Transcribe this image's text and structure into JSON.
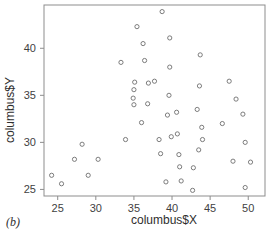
{
  "figure": {
    "panel_label": "(b)",
    "background_color": "#ffffff",
    "frame_color": "#8d8d8d",
    "point_color": "#6e6e6e"
  },
  "chart_data": {
    "type": "scatter",
    "title": "",
    "xlabel": "columbus$X",
    "ylabel": "columbus$Y",
    "xlim": [
      23.2,
      52.2
    ],
    "ylim": [
      24.3,
      44.6
    ],
    "xticks": [
      25,
      30,
      35,
      40,
      45,
      50
    ],
    "yticks": [
      25,
      30,
      35,
      40
    ],
    "xtick_labels": [
      "25",
      "30",
      "35",
      "40",
      "45",
      "50"
    ],
    "ytick_labels": [
      "25",
      "30",
      "35",
      "40"
    ],
    "grid": false,
    "legend": null,
    "marker": "open-circle",
    "n_points": 49,
    "points": [
      [
        24.2,
        26.5
      ],
      [
        25.5,
        25.6
      ],
      [
        27.2,
        28.2
      ],
      [
        28.2,
        29.8
      ],
      [
        29.0,
        26.5
      ],
      [
        30.3,
        28.2
      ],
      [
        33.3,
        38.5
      ],
      [
        33.9,
        30.3
      ],
      [
        34.9,
        34.7
      ],
      [
        35.0,
        35.6
      ],
      [
        35.0,
        34.0
      ],
      [
        35.1,
        36.4
      ],
      [
        35.4,
        42.3
      ],
      [
        36.0,
        32.1
      ],
      [
        36.2,
        40.5
      ],
      [
        36.4,
        38.7
      ],
      [
        36.8,
        34.1
      ],
      [
        36.9,
        36.3
      ],
      [
        37.7,
        36.5
      ],
      [
        38.3,
        30.3
      ],
      [
        38.5,
        28.8
      ],
      [
        38.7,
        43.9
      ],
      [
        39.2,
        25.8
      ],
      [
        39.4,
        32.9
      ],
      [
        39.6,
        35.0
      ],
      [
        39.7,
        41.1
      ],
      [
        39.7,
        38.0
      ],
      [
        39.9,
        30.6
      ],
      [
        40.6,
        33.2
      ],
      [
        40.7,
        30.9
      ],
      [
        40.9,
        28.7
      ],
      [
        41.0,
        27.4
      ],
      [
        41.2,
        25.9
      ],
      [
        42.7,
        24.9
      ],
      [
        42.8,
        27.3
      ],
      [
        43.3,
        33.5
      ],
      [
        43.5,
        29.2
      ],
      [
        43.6,
        36.0
      ],
      [
        43.7,
        39.3
      ],
      [
        43.9,
        31.6
      ],
      [
        44.0,
        30.3
      ],
      [
        46.6,
        32.0
      ],
      [
        47.5,
        36.5
      ],
      [
        48.0,
        28.0
      ],
      [
        48.4,
        34.6
      ],
      [
        49.3,
        33.0
      ],
      [
        49.6,
        30.0
      ],
      [
        49.6,
        25.2
      ],
      [
        50.3,
        27.9
      ]
    ]
  }
}
